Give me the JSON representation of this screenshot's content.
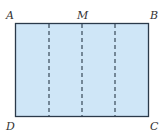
{
  "figure": {
    "type": "rectangle-folding-diagram",
    "fill_color": "#cfe6f7",
    "stroke_color": "#2b3a4a",
    "vertices": {
      "A": "A",
      "B": "B",
      "C": "C",
      "D": "D",
      "M": "M"
    },
    "dashed_lines": 3
  }
}
